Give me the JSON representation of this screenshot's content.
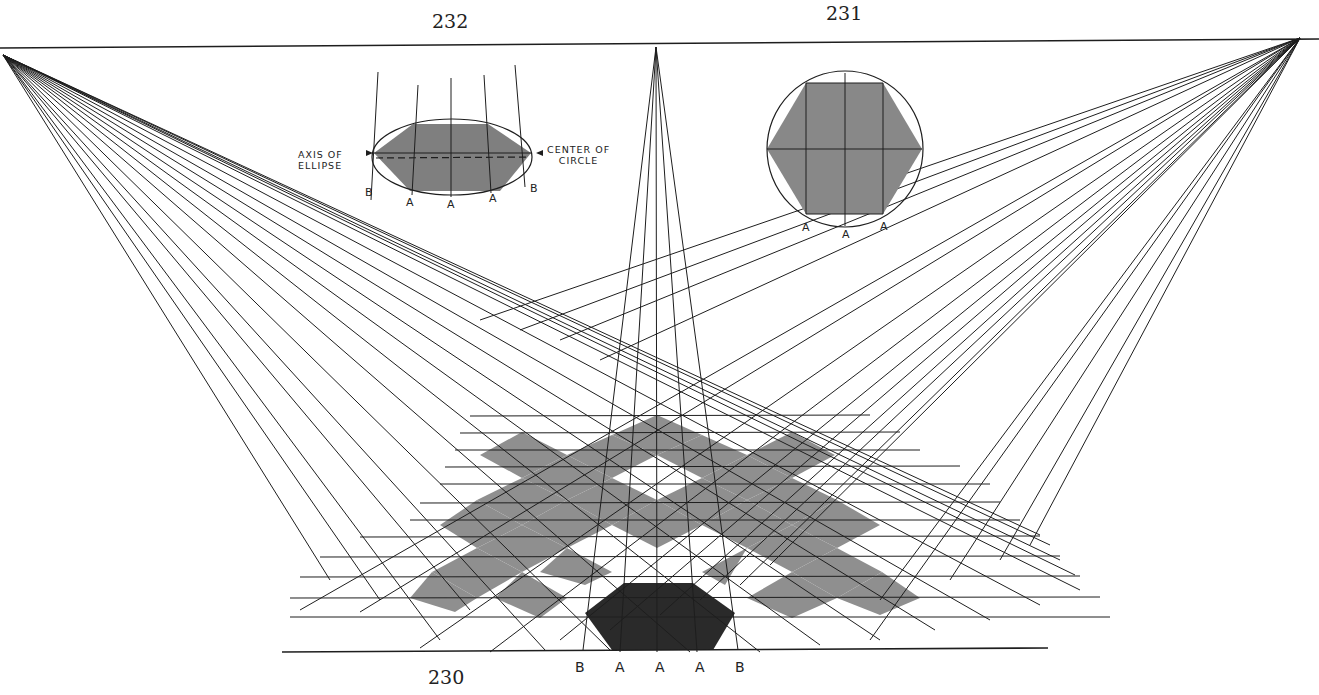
{
  "figures": {
    "fig230": {
      "number": "230",
      "ground_labels": [
        "B",
        "A",
        "A",
        "A",
        "B"
      ]
    },
    "fig231": {
      "number": "231",
      "labels": [
        "A",
        "A",
        "A"
      ]
    },
    "fig232": {
      "number": "232",
      "labels": [
        "B",
        "A",
        "A",
        "A",
        "B"
      ],
      "callout_left": "AXIS OF ELLIPSE",
      "callout_left_line1": "AXIS OF",
      "callout_left_line2": "ELLIPSE",
      "callout_right_line1": "CENTER OF",
      "callout_right_line2": "CIRCLE"
    }
  },
  "geometry": {
    "horizon_y": 45,
    "vp_left": [
      3,
      55
    ],
    "vp_center": [
      656,
      47
    ],
    "vp_right": [
      1300,
      38
    ],
    "ground_line_y": 652
  },
  "colors": {
    "ink": "#1e1e1e",
    "light_tone": "#8f8f8f",
    "dark_tone": "#2a2a2a",
    "paper": "#ffffff"
  }
}
